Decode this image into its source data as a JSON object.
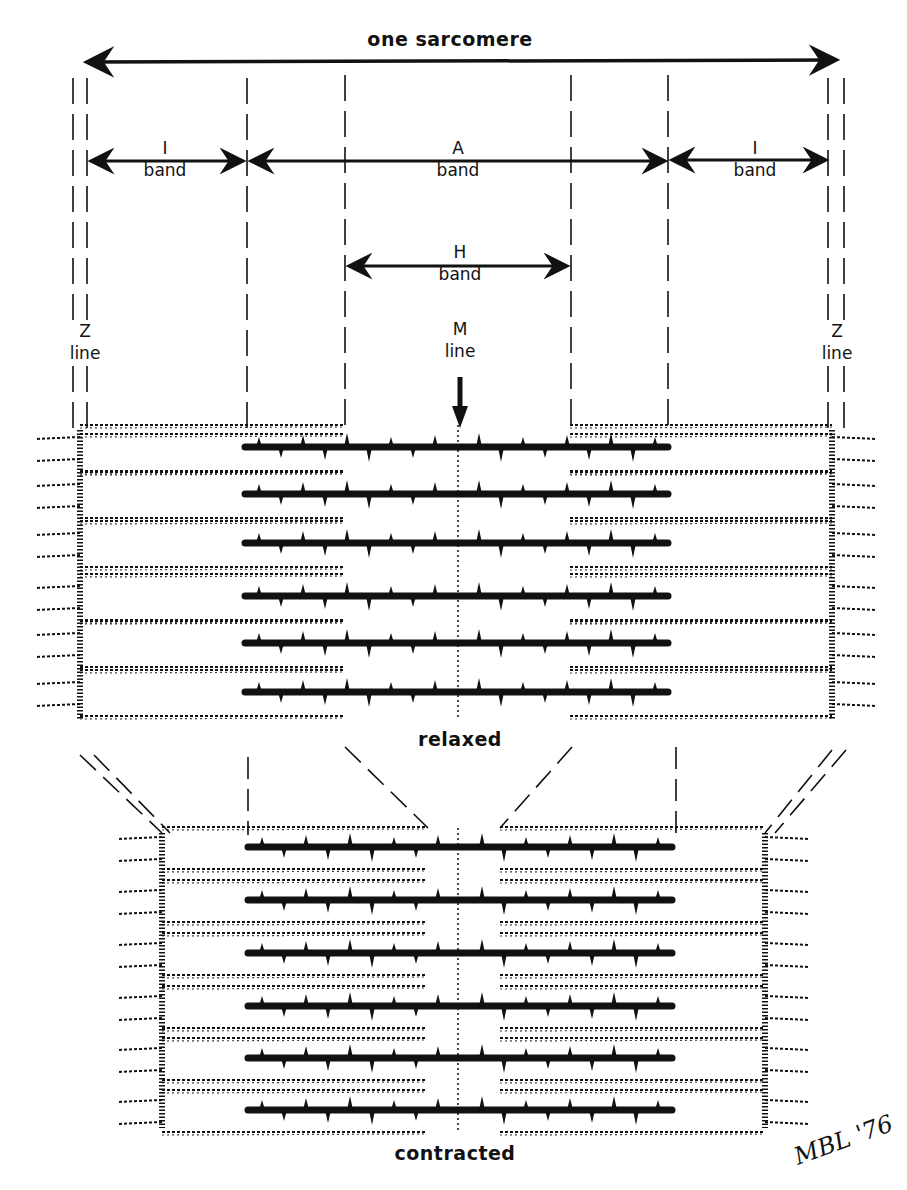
{
  "diagram": {
    "title": "one sarcomere",
    "labels": {
      "i_band_left": {
        "line1": "I",
        "line2": "band"
      },
      "a_band": {
        "line1": "A",
        "line2": "band"
      },
      "i_band_right": {
        "line1": "I",
        "line2": "band"
      },
      "h_band": {
        "line1": "H",
        "line2": "band"
      },
      "m_line": {
        "line1": "M",
        "line2": "line"
      },
      "z_line_left": {
        "line1": "Z",
        "line2": "line"
      },
      "z_line_right": {
        "line1": "Z",
        "line2": "line"
      }
    },
    "states": {
      "relaxed": "relaxed",
      "contracted": "contracted"
    },
    "signature": "MBL '76",
    "colors": {
      "ink": "#111111",
      "background": "#ffffff"
    },
    "geometry": {
      "relaxed": {
        "z_left_x": 80,
        "z_right_x": 832,
        "a_left_x": 245,
        "a_right_x": 668,
        "h_left_x": 344,
        "h_right_x": 570,
        "m_x": 458,
        "top_y": 430,
        "bottom_y": 690,
        "thick_rows_y": [
          447,
          494,
          543,
          596,
          643,
          692
        ]
      },
      "contracted": {
        "z_left_x": 162,
        "z_right_x": 765,
        "a_left_x": 248,
        "a_right_x": 672,
        "thin_left_end_x": 425,
        "thin_right_start_x": 500,
        "m_x": 458,
        "top_y": 833,
        "bottom_y": 1128,
        "thick_rows_y": [
          847,
          900,
          953,
          1006,
          1058,
          1110
        ]
      }
    }
  }
}
